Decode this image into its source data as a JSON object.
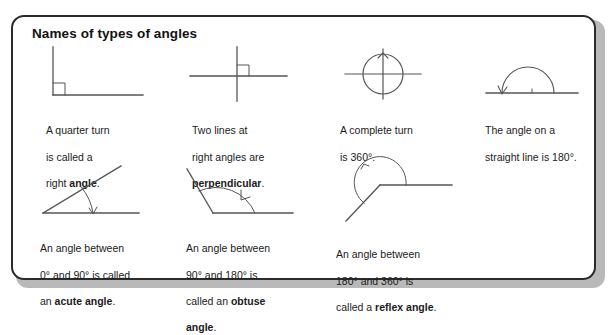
{
  "panel": {
    "title": "Names of types of angles",
    "border_color": "#2b2b2b",
    "background_color": "#ffffff",
    "shadow_color": "#b9b9b9",
    "text_color": "#1b1b1b",
    "stroke_color": "#555555"
  },
  "items": [
    {
      "id": "right-angle",
      "figure": "right-angle-diagram",
      "figure_description": "Vertical ray up and horizontal ray right from a corner, with a small square right-angle marker",
      "caption_line1": "A quarter turn",
      "caption_line2": "is called a",
      "caption_line3_plain": "right ",
      "caption_line3_bold": "angle",
      "caption_line3_tail": "."
    },
    {
      "id": "perpendicular",
      "figure": "perpendicular-lines-diagram",
      "figure_description": "Two lines crossing at right angles with a small square marker in the upper-right quadrant",
      "caption_line1": "Two lines at",
      "caption_line2": "right angles are",
      "caption_line3_plain": "",
      "caption_line3_bold": "perpendicular",
      "caption_line3_tail": "."
    },
    {
      "id": "complete-turn",
      "figure": "complete-turn-diagram",
      "figure_description": "A circle with horizontal and vertical crosshairs and an arrowhead at the top",
      "caption_line1": "A complete turn",
      "caption_line2": "is 360°.",
      "caption_line3_plain": "",
      "caption_line3_bold": "",
      "caption_line3_tail": ""
    },
    {
      "id": "straight-line-angle",
      "figure": "straight-line-diagram",
      "figure_description": "A horizontal line with a semicircular arc above it and an arrow pointing left",
      "caption_line1": "The angle on a",
      "caption_line2": "straight line is 180°.",
      "caption_line3_plain": "",
      "caption_line3_bold": "",
      "caption_line3_tail": ""
    },
    {
      "id": "acute-angle",
      "figure": "acute-angle-diagram",
      "figure_description": "Horizontal base ray and a ray rising at about 40 degrees, with a small arc and arrow",
      "caption_line1": "An angle between",
      "caption_line2": "0° and 90° is called",
      "caption_line3_plain": "an ",
      "caption_line3_bold": "acute angle",
      "caption_line3_tail": "."
    },
    {
      "id": "obtuse-angle",
      "figure": "obtuse-angle-diagram",
      "figure_description": "Horizontal base ray and a ray rising back at about 135 degrees, with an arc and arrow",
      "caption_line1": "An angle between",
      "caption_line2": "90° and 180° is",
      "caption_line3_plain": "called an ",
      "caption_line3_bold": "obtuse",
      "caption_line3_tail": "",
      "caption_line4_bold": "angle",
      "caption_line4_tail": "."
    },
    {
      "id": "reflex-angle",
      "figure": "reflex-angle-diagram",
      "figure_description": "A vertex with a horizontal ray right and a ray down-left, with a large arc sweeping the outside reflex region",
      "caption_line1": "An angle between",
      "caption_line2": "180° and 360° is",
      "caption_line3_plain": "called a ",
      "caption_line3_bold": "reflex angle",
      "caption_line3_tail": "."
    }
  ]
}
